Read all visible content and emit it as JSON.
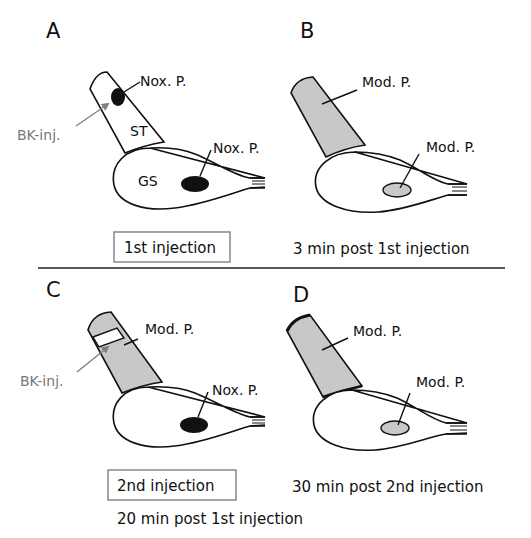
{
  "figure": {
    "divider": true,
    "colors": {
      "outline": "#111111",
      "noxious_fill": "#111111",
      "moderate_fill": "#c8c8c8",
      "bk_arrow": "#808080",
      "box_border": "#808080"
    },
    "panels": [
      {
        "letter": "A",
        "structures": {
          "st_label": "ST",
          "gs_label": "GS"
        },
        "st_state": "Nox. P.",
        "gs_state": "Nox. P.",
        "injection_label": "BK-inj.",
        "caption_boxed": "1st injection"
      },
      {
        "letter": "B",
        "st_state": "Mod. P.",
        "gs_state": "Mod. P.",
        "caption": "3 min post 1st injection"
      },
      {
        "letter": "C",
        "st_state": "Mod. P.",
        "gs_state": "Nox. P.",
        "injection_label": "BK-inj.",
        "caption_boxed": "2nd injection",
        "caption": "20 min post 1st injection"
      },
      {
        "letter": "D",
        "st_state": "Mod. P.",
        "gs_state": "Mod. P.",
        "caption": "30 min post 2nd injection"
      }
    ]
  }
}
